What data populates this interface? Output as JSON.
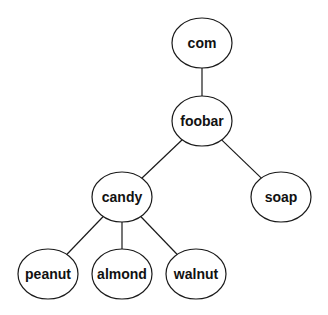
{
  "diagram": {
    "type": "tree",
    "nodes": [
      {
        "id": "com",
        "label": "com",
        "cx": 202,
        "cy": 43
      },
      {
        "id": "foobar",
        "label": "foobar",
        "cx": 202,
        "cy": 121
      },
      {
        "id": "candy",
        "label": "candy",
        "cx": 122,
        "cy": 197
      },
      {
        "id": "soap",
        "label": "soap",
        "cx": 281,
        "cy": 197
      },
      {
        "id": "peanut",
        "label": "peanut",
        "cx": 48,
        "cy": 274
      },
      {
        "id": "almond",
        "label": "almond",
        "cx": 122,
        "cy": 274
      },
      {
        "id": "walnut",
        "label": "walnut",
        "cx": 196,
        "cy": 274
      }
    ],
    "edges": [
      {
        "from": "com",
        "to": "foobar"
      },
      {
        "from": "foobar",
        "to": "candy"
      },
      {
        "from": "foobar",
        "to": "soap"
      },
      {
        "from": "candy",
        "to": "peanut"
      },
      {
        "from": "candy",
        "to": "almond"
      },
      {
        "from": "candy",
        "to": "walnut"
      }
    ],
    "node_rx": 30,
    "node_ry": 25,
    "stroke_color": "#1a1a1a",
    "fill_color": "#ffffff",
    "text_color": "#111111"
  }
}
